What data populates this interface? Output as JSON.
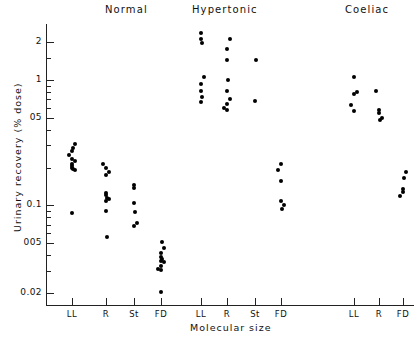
{
  "chart_data": {
    "type": "scatter",
    "title": "",
    "xlabel": "Molecular size",
    "ylabel": "Urinary recovery (% dose)",
    "yscale": "log",
    "ylim": [
      0.02,
      2.6
    ],
    "grid": false,
    "legend": false,
    "y_ticks": [
      {
        "value": 2,
        "label": "2"
      },
      {
        "value": 1,
        "label": "1"
      },
      {
        "value": 0.5,
        "label": "05"
      },
      {
        "value": 0.1,
        "label": "0.1"
      },
      {
        "value": 0.05,
        "label": "005"
      },
      {
        "value": 0.02,
        "label": "0.02"
      }
    ],
    "y_minor_ticks": [
      1.5,
      0.9,
      0.8,
      0.7,
      0.6,
      0.4,
      0.3,
      0.2,
      0.09,
      0.08,
      0.07,
      0.06,
      0.04,
      0.03
    ],
    "group_titles": [
      "Normal",
      "Hypertonic",
      "Coeliac"
    ],
    "x_categories": [
      "LL",
      "R",
      "St",
      "FD"
    ],
    "groups": [
      {
        "name": "Normal",
        "columns": [
          {
            "label": "LL",
            "values": [
              0.31,
              0.285,
              0.27,
              0.25,
              0.235,
              0.225,
              0.215,
              0.205,
              0.2,
              0.195,
              0.19,
              0.087
            ]
          },
          {
            "label": "R",
            "values": [
              0.215,
              0.2,
              0.185,
              0.175,
              0.125,
              0.12,
              0.115,
              0.112,
              0.108,
              0.09,
              0.056
            ]
          },
          {
            "label": "St",
            "values": [
              0.145,
              0.138,
              0.105,
              0.088,
              0.072,
              0.068
            ]
          },
          {
            "label": "FD",
            "values": [
              0.051,
              0.046,
              0.042,
              0.039,
              0.037,
              0.036,
              0.0355,
              0.033,
              0.031,
              0.0305,
              0.0205
            ]
          }
        ]
      },
      {
        "name": "Hypertonic",
        "columns": [
          {
            "label": "LL",
            "values": [
              2.35,
              2.1,
              1.95,
              1.05,
              0.93,
              0.82,
              0.73,
              0.66
            ]
          },
          {
            "label": "R",
            "values": [
              2.1,
              1.75,
              1.45,
              1.0,
              0.82,
              0.7,
              0.64,
              0.6,
              0.57
            ]
          },
          {
            "label": "St",
            "values": [
              1.45,
              0.68
            ]
          },
          {
            "label": "FD",
            "values": [
              0.215,
              0.19,
              0.155,
              0.108,
              0.1,
              0.093
            ]
          }
        ]
      },
      {
        "name": "Coeliac",
        "columns": [
          {
            "label": "LL",
            "values": [
              1.05,
              0.8,
              0.77,
              0.63,
              0.56
            ]
          },
          {
            "label": "R",
            "values": [
              0.82,
              0.57,
              0.545,
              0.5,
              0.48
            ]
          },
          {
            "label": "FD",
            "values": [
              0.185,
              0.165,
              0.135,
              0.128,
              0.118
            ]
          }
        ]
      }
    ]
  }
}
